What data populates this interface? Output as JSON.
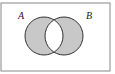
{
  "diagram": {
    "type": "venn",
    "shaded_region": "symmetric difference (A xor B)",
    "labels": {
      "a": "A",
      "b": "B"
    },
    "colors": {
      "fill": "#c8c8c8",
      "stroke": "#333333",
      "border": "#888888",
      "background": "#ffffff"
    }
  }
}
